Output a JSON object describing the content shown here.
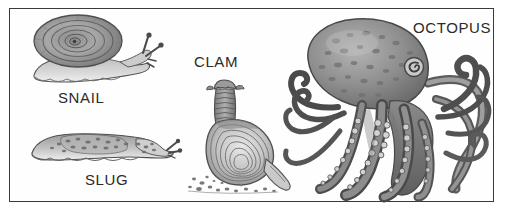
{
  "plate": {
    "title": "Mollusk illustration plate",
    "background_color": "#ffffff",
    "frame_color": "#3a3a3a",
    "ink_color": "#4a4a4a",
    "label_color": "#2b2b2b",
    "style": "grayscale pen-and-ink stipple drawing"
  },
  "figures": [
    {
      "id": "snail",
      "label": "SNAIL",
      "label_x": 57,
      "label_y": 88,
      "icon": "snail-illustration",
      "description": "coiled spiral shell with body and two eyestalks"
    },
    {
      "id": "slug",
      "label": "SLUG",
      "label_x": 84,
      "label_y": 170,
      "icon": "slug-illustration",
      "description": "elongated speckled body with wavy foot and tentacles"
    },
    {
      "id": "clam",
      "label": "CLAM",
      "label_x": 193,
      "label_y": 52,
      "icon": "clam-illustration",
      "description": "ridged siphon above concentric-ringed shell with extended foot on sand"
    },
    {
      "id": "octopus",
      "label": "OCTOPUS",
      "label_x": 412,
      "label_y": 18,
      "icon": "octopus-illustration",
      "description": "mottled mantle with eye and eight curling suckered arms"
    }
  ]
}
